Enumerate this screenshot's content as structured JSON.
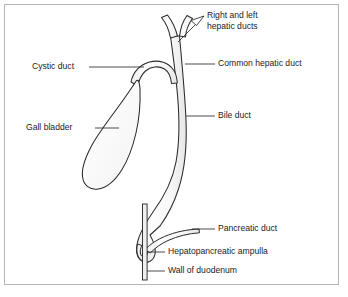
{
  "figure": {
    "background_color": "#ffffff",
    "frame_color": "#b4b4b4",
    "outline_color": "#2b2b2b",
    "shading_color": "#d8d8d8",
    "text_color": "#1c1c1c"
  },
  "labels": {
    "hepatic_ducts_line1": "Right and left",
    "hepatic_ducts_line2": "hepatic ducts",
    "common_hepatic_duct": "Common hepatic duct",
    "cystic_duct": "Cystic duct",
    "bile_duct": "Bile duct",
    "gall_bladder": "Gall bladder",
    "pancreatic_duct": "Pancreatic duct",
    "hepatopancreatic_ampulla": "Hepatopancreatic ampulla",
    "wall_of_duodenum": "Wall of duodenum"
  },
  "structures": [
    {
      "name": "right-and-left-hepatic-ducts",
      "label": "Right and left hepatic ducts"
    },
    {
      "name": "common-hepatic-duct",
      "label": "Common hepatic duct"
    },
    {
      "name": "cystic-duct",
      "label": "Cystic duct"
    },
    {
      "name": "bile-duct",
      "label": "Bile duct"
    },
    {
      "name": "gall-bladder",
      "label": "Gall bladder"
    },
    {
      "name": "pancreatic-duct",
      "label": "Pancreatic duct"
    },
    {
      "name": "hepatopancreatic-ampulla",
      "label": "Hepatopancreatic ampulla"
    },
    {
      "name": "wall-of-duodenum",
      "label": "Wall of duodenum"
    }
  ]
}
